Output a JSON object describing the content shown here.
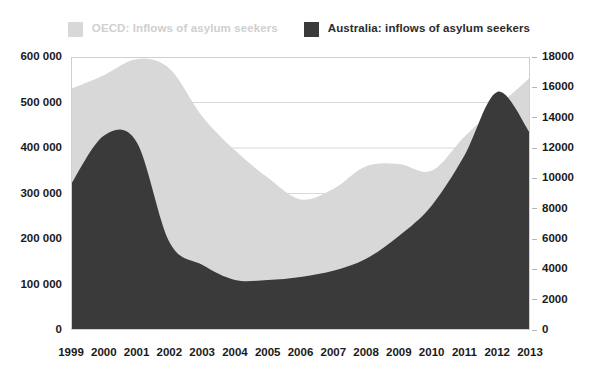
{
  "legend": {
    "position": "top-center",
    "entries": [
      {
        "label": "OECD: Inflows of asylum seekers",
        "color": "#d8d8d8",
        "axis": "left"
      },
      {
        "label": "Australia: inflows of asylum seekers",
        "color": "#3a3a3a",
        "axis": "right"
      }
    ]
  },
  "chart_data": {
    "type": "area",
    "title": "",
    "subtitle": "",
    "xlabel": "",
    "ylabel": "",
    "grid": true,
    "categories": [
      "1999",
      "2000",
      "2001",
      "2002",
      "2003",
      "2004",
      "2005",
      "2006",
      "2007",
      "2008",
      "2009",
      "2010",
      "2011",
      "2012",
      "2013"
    ],
    "axes": {
      "left": {
        "label": "",
        "lim": [
          0,
          600000
        ],
        "ticks": [
          0,
          100000,
          200000,
          300000,
          400000,
          500000,
          600000
        ],
        "ticklabels": [
          "0",
          "100 000",
          "200 000",
          "300 000",
          "400 000",
          "500 000",
          "600 000"
        ]
      },
      "right": {
        "label": "",
        "lim": [
          0,
          18000
        ],
        "ticks": [
          0,
          2000,
          4000,
          6000,
          8000,
          10000,
          12000,
          14000,
          16000,
          18000
        ],
        "ticklabels": [
          "0",
          "2000",
          "4000",
          "6000",
          "8000",
          "10000",
          "12000",
          "14000",
          "16000",
          "18000"
        ]
      }
    },
    "series": [
      {
        "name": "OECD: Inflows of asylum seekers",
        "axis": "left",
        "color": "#d8d8d8",
        "values": [
          530000,
          560000,
          595000,
          575000,
          470000,
          395000,
          335000,
          287000,
          310000,
          360000,
          365000,
          350000,
          425000,
          490000,
          555000
        ]
      },
      {
        "name": "Australia: inflows of asylum seekers",
        "axis": "right",
        "color": "#3a3a3a",
        "values": [
          9600,
          12800,
          12400,
          5800,
          4300,
          3300,
          3300,
          3500,
          3900,
          4700,
          6200,
          8200,
          11500,
          15700,
          13000
        ]
      }
    ]
  }
}
